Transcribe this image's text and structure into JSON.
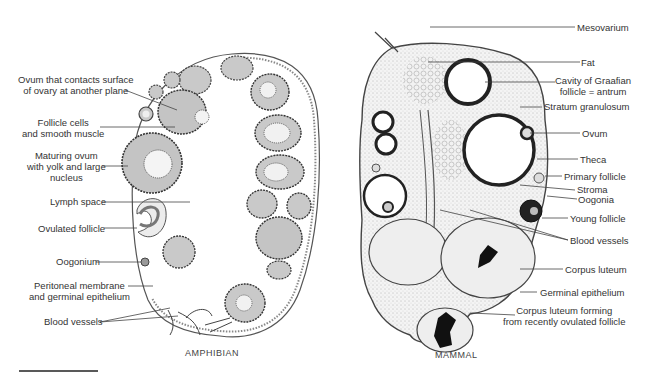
{
  "figure": {
    "panels": [
      {
        "caption": "AMPHIBIAN",
        "labels": [
          {
            "id": "ovum-contacts-surface",
            "lines": [
              "Ovum that contacts surface",
              "of ovary at another plane"
            ]
          },
          {
            "id": "follicle-cells",
            "lines": [
              "Follicle cells",
              "and smooth muscle"
            ]
          },
          {
            "id": "maturing-ovum",
            "lines": [
              "Maturing ovum",
              "with yolk and large",
              "nucleus"
            ]
          },
          {
            "id": "lymph-space",
            "lines": [
              "Lymph space"
            ]
          },
          {
            "id": "ovulated-follicle",
            "lines": [
              "Ovulated follicle"
            ]
          },
          {
            "id": "oogonium",
            "lines": [
              "Oogonium"
            ]
          },
          {
            "id": "peritoneal-membrane",
            "lines": [
              "Peritoneal membrane",
              "and germinal epithelium"
            ]
          },
          {
            "id": "blood-vessels",
            "lines": [
              "Blood vessels"
            ]
          }
        ]
      },
      {
        "caption": "MAMMAL",
        "labels": [
          {
            "id": "mesovarium",
            "lines": [
              "Mesovarium"
            ]
          },
          {
            "id": "fat",
            "lines": [
              "Fat"
            ]
          },
          {
            "id": "cavity-graafian",
            "lines": [
              "Cavity of Graafian",
              "follicle = antrum"
            ]
          },
          {
            "id": "stratum-granulosum",
            "lines": [
              "Stratum granulosum"
            ]
          },
          {
            "id": "ovum",
            "lines": [
              "Ovum"
            ]
          },
          {
            "id": "theca",
            "lines": [
              "Theca"
            ]
          },
          {
            "id": "primary-follicle",
            "lines": [
              "Primary follicle"
            ]
          },
          {
            "id": "stroma",
            "lines": [
              "Stroma"
            ]
          },
          {
            "id": "oogonia",
            "lines": [
              "Oogonia"
            ]
          },
          {
            "id": "young-follicle",
            "lines": [
              "Young follicle"
            ]
          },
          {
            "id": "blood-vessels",
            "lines": [
              "Blood vessels"
            ]
          },
          {
            "id": "corpus-luteum",
            "lines": [
              "Corpus luteum"
            ]
          },
          {
            "id": "germinal-epithelium",
            "lines": [
              "Germinal epithelium"
            ]
          },
          {
            "id": "corpus-luteum-forming",
            "lines": [
              "Corpus luteum forming",
              "from recently ovulated follicle"
            ]
          }
        ]
      }
    ]
  }
}
